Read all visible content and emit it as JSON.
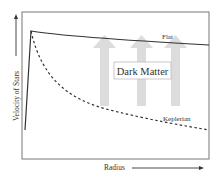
{
  "diagram": {
    "type": "rotation-curve",
    "y_axis_label": "Velocity of Stars",
    "x_axis_label": "Radius",
    "curves": [
      {
        "name": "Flat",
        "style": "solid"
      },
      {
        "name": "Keplerian",
        "style": "dashed"
      }
    ],
    "box_label": "Dark Matter",
    "colors": {
      "axes": "#6e6e6e",
      "curve": "#333333",
      "arrows": "#d9d9d9",
      "box_border": "#bbbbbb"
    }
  }
}
